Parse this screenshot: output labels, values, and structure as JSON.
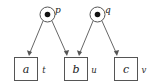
{
  "figure": {
    "type": "petri-net-diagram",
    "background_color": "#ffffff",
    "stroke_color": "#555555",
    "token_color": "#111111",
    "text_color": "#1a1a1a"
  },
  "places": [
    {
      "id": "p",
      "label": "p",
      "shape": "circle-with-token",
      "cx": 47.5,
      "cy": 14.5,
      "r": 7.5,
      "token_r": 2.8,
      "label_x": 58,
      "label_y": 12
    },
    {
      "id": "q",
      "label": "q",
      "shape": "circle-with-token",
      "cx": 97.5,
      "cy": 14.5,
      "r": 7.5,
      "token_r": 2.8,
      "label_x": 108,
      "label_y": 12
    }
  ],
  "transitions": [
    {
      "id": "a",
      "label": "a",
      "side_label": "t",
      "shape": "square",
      "x": 14,
      "y": 57,
      "w": 24,
      "h": 24,
      "label_x": 26,
      "label_y": 73,
      "side_label_x": 44,
      "side_label_y": 73
    },
    {
      "id": "b",
      "label": "b",
      "side_label": "u",
      "shape": "square",
      "x": 64,
      "y": 57,
      "w": 24,
      "h": 24,
      "label_x": 76,
      "label_y": 73,
      "side_label_x": 94,
      "side_label_y": 73
    },
    {
      "id": "c",
      "label": "c",
      "side_label": "v",
      "shape": "square",
      "x": 114,
      "y": 57,
      "w": 24,
      "h": 24,
      "label_x": 126,
      "label_y": 73,
      "side_label_x": 144,
      "side_label_y": 73
    }
  ],
  "arcs": [
    {
      "id": "p-to-a",
      "from": "p",
      "to": "a",
      "x1": 43,
      "y1": 21,
      "x2": 29,
      "y2": 55
    },
    {
      "id": "p-to-b",
      "from": "p",
      "to": "b",
      "x1": 52,
      "y1": 21,
      "x2": 67,
      "y2": 55
    },
    {
      "id": "q-to-b",
      "from": "q",
      "to": "b",
      "x1": 93,
      "y1": 21,
      "x2": 79,
      "y2": 55
    },
    {
      "id": "q-to-c",
      "from": "q",
      "to": "c",
      "x1": 102,
      "y1": 21,
      "x2": 117,
      "y2": 55
    }
  ]
}
